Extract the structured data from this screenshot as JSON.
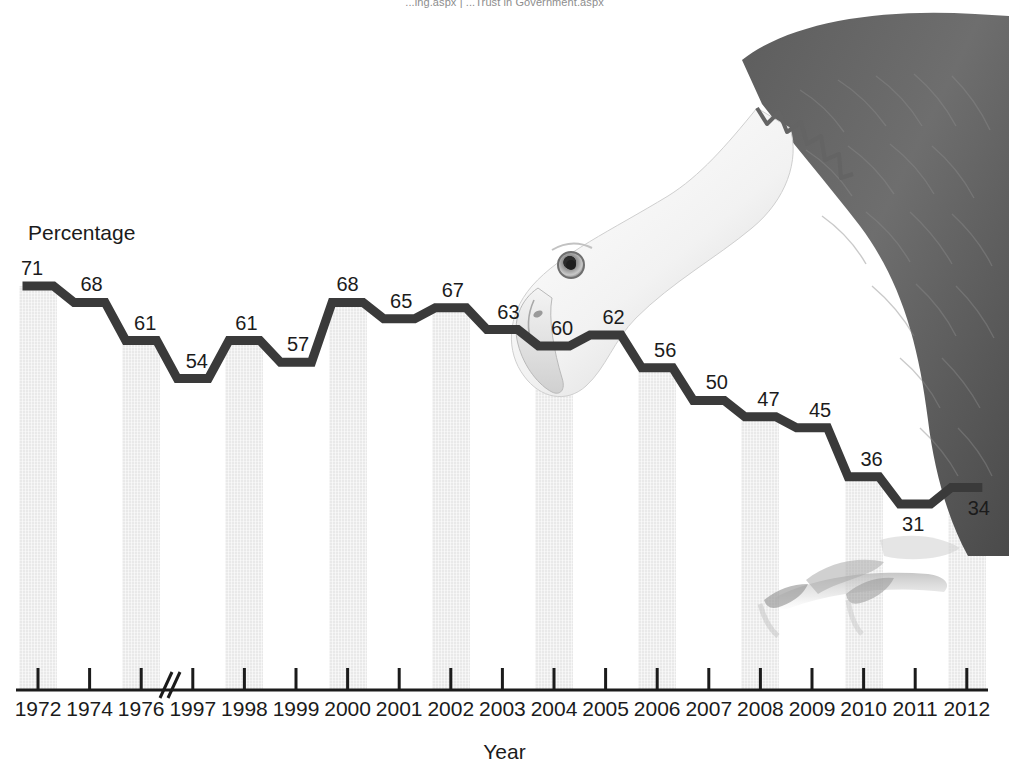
{
  "header": {
    "cropped_text": "...ing.aspx  |  ...Trust in Government.aspx"
  },
  "figure": {
    "illustration": "bald-eagle-photo"
  },
  "chart_data": {
    "type": "line",
    "title": "",
    "xlabel": "Year",
    "ylabel": "Percentage",
    "grid": false,
    "legend": "none",
    "axis_break_after_category": "1976",
    "ylim": [
      0,
      80
    ],
    "categories": [
      "1972",
      "1974",
      "1976",
      "1997",
      "1998",
      "1999",
      "2000",
      "2001",
      "2002",
      "2003",
      "2004",
      "2005",
      "2006",
      "2007",
      "2008",
      "2009",
      "2010",
      "2011",
      "2012"
    ],
    "values": [
      71,
      68,
      61,
      54,
      61,
      57,
      68,
      65,
      67,
      63,
      60,
      62,
      56,
      50,
      47,
      45,
      36,
      31,
      34
    ],
    "series": [
      {
        "name": "Percentage",
        "values": [
          71,
          68,
          61,
          54,
          61,
          57,
          68,
          65,
          67,
          63,
          60,
          62,
          56,
          50,
          47,
          45,
          36,
          31,
          34
        ]
      }
    ],
    "shaded_band_categories": [
      "1972",
      "1976",
      "1998",
      "2000",
      "2002",
      "2004",
      "2006",
      "2008",
      "2010",
      "2012"
    ],
    "colors": {
      "line": "#3a3a3a",
      "band": "#e9e9e9",
      "axis": "#1b1b1b",
      "label_text": "#1b1b1b",
      "background": "#ffffff"
    }
  }
}
